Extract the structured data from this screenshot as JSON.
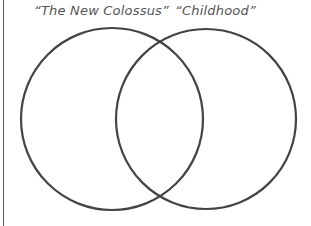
{
  "diagram": {
    "type": "venn",
    "sets": [
      {
        "label": "“The New Colossus”",
        "cx": 112,
        "cy": 119,
        "r": 91
      },
      {
        "label": "“Childhood”",
        "cx": 206,
        "cy": 119,
        "r": 90
      }
    ],
    "stroke_color": "#444444"
  }
}
